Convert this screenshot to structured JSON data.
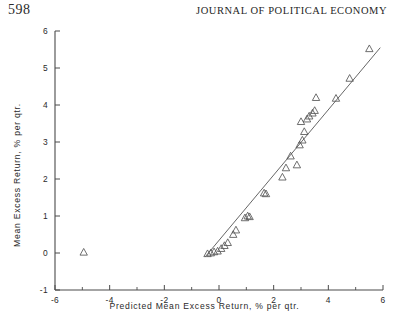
{
  "header": {
    "page_number": "598",
    "journal_title": "JOURNAL OF POLITICAL ECONOMY"
  },
  "chart_data": {
    "type": "scatter",
    "title": "",
    "xlabel": "Predicted Mean Excess Return, % per qtr.",
    "ylabel": "Mean Excess Return, % per qtr.",
    "xlim": [
      -6,
      6
    ],
    "ylim": [
      -1,
      6
    ],
    "xticks": [
      -6,
      -4,
      -2,
      0,
      2,
      4,
      6
    ],
    "xticklabels": [
      "-6",
      "-4",
      "-2",
      "0",
      "2",
      "4",
      "6"
    ],
    "xminorticks": [
      -5,
      -3,
      -1,
      1,
      3,
      5
    ],
    "yticks": [
      -1,
      0,
      1,
      2,
      3,
      4,
      5,
      6
    ],
    "yticklabels": [
      "-1",
      "0",
      "1",
      "2",
      "3",
      "4",
      "5",
      "6"
    ],
    "grid": false,
    "legend": null,
    "marker": "triangle-up-open",
    "marker_color": "#555555",
    "line_color": "#555555",
    "fit_line": {
      "label": "45-degree reference line",
      "x": [
        -0.5,
        5.9
      ],
      "y": [
        -0.1,
        5.55
      ]
    },
    "points": [
      {
        "x": -4.95,
        "y": 0.02
      },
      {
        "x": -0.42,
        "y": -0.02
      },
      {
        "x": -0.3,
        "y": 0.0
      },
      {
        "x": -0.18,
        "y": 0.03
      },
      {
        "x": -0.05,
        "y": 0.05
      },
      {
        "x": 0.08,
        "y": 0.12
      },
      {
        "x": 0.2,
        "y": 0.2
      },
      {
        "x": 0.32,
        "y": 0.28
      },
      {
        "x": 0.52,
        "y": 0.5
      },
      {
        "x": 0.62,
        "y": 0.62
      },
      {
        "x": 0.95,
        "y": 0.95
      },
      {
        "x": 1.05,
        "y": 1.0
      },
      {
        "x": 1.12,
        "y": 0.98
      },
      {
        "x": 1.65,
        "y": 1.62
      },
      {
        "x": 1.72,
        "y": 1.6
      },
      {
        "x": 2.32,
        "y": 2.05
      },
      {
        "x": 2.45,
        "y": 2.3
      },
      {
        "x": 2.62,
        "y": 2.62
      },
      {
        "x": 2.85,
        "y": 2.38
      },
      {
        "x": 2.95,
        "y": 2.92
      },
      {
        "x": 3.0,
        "y": 3.55
      },
      {
        "x": 3.05,
        "y": 3.05
      },
      {
        "x": 3.12,
        "y": 3.28
      },
      {
        "x": 3.22,
        "y": 3.62
      },
      {
        "x": 3.3,
        "y": 3.7
      },
      {
        "x": 3.42,
        "y": 3.78
      },
      {
        "x": 3.5,
        "y": 3.85
      },
      {
        "x": 3.55,
        "y": 4.2
      },
      {
        "x": 4.28,
        "y": 4.18
      },
      {
        "x": 4.78,
        "y": 4.72
      },
      {
        "x": 5.5,
        "y": 5.52
      }
    ]
  }
}
